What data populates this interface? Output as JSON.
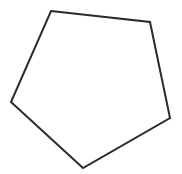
{
  "diagram": {
    "type": "polygon",
    "shape": "pentagon",
    "background": "#ffffff",
    "stroke_color": "#2b2b2b",
    "stroke_width": 2,
    "fill": "none",
    "vertices": [
      [
        51,
        11
      ],
      [
        150,
        22
      ],
      [
        170,
        118
      ],
      [
        83,
        168
      ],
      [
        11,
        102
      ]
    ]
  }
}
